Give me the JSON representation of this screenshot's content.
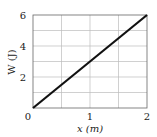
{
  "chart_data": {
    "type": "line",
    "title": "",
    "xlabel": "x (m)",
    "ylabel": "W (J)",
    "xlim": [
      0,
      2
    ],
    "ylim": [
      0,
      6
    ],
    "x_ticks": [
      "0",
      "1",
      "2"
    ],
    "y_ticks": [
      "2",
      "4",
      "6"
    ],
    "origin_label": "0",
    "grid": true,
    "series": [
      {
        "name": "W",
        "x": [
          0,
          2
        ],
        "y": [
          0,
          6
        ],
        "color": "#111111"
      }
    ]
  }
}
